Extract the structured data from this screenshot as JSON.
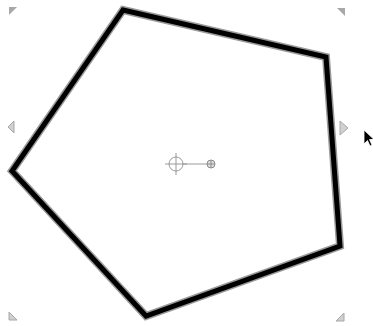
{
  "canvas": {
    "background": "#ffffff",
    "width": 373,
    "height": 326
  },
  "shape": {
    "type": "pentagon",
    "stroke_color": "#000000",
    "halo_color": "#9a9a9a",
    "stroke_width": 5,
    "fill": "none",
    "points": "123,10 326,57 340,246 146,316 12,171",
    "selected": true
  },
  "selection": {
    "handle_color": "#a8a8a8",
    "handles": {
      "top_left": {
        "x": 9,
        "y": 7
      },
      "top_right": {
        "x": 337,
        "y": 8
      },
      "left": {
        "x": 8,
        "y": 127
      },
      "right": {
        "x": 340,
        "y": 128
      },
      "bottom_left": {
        "x": 9,
        "y": 312
      },
      "bottom_right": {
        "x": 336,
        "y": 313
      }
    }
  },
  "rotation": {
    "center": {
      "x": 176,
      "y": 164
    },
    "center_radius": 7,
    "handle": {
      "x": 211,
      "y": 164
    },
    "handle_radius": 4,
    "color": "#9a9a9a"
  },
  "cursor": {
    "type": "arrow",
    "x": 364,
    "y": 130
  }
}
